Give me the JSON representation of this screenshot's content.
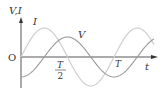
{
  "chart_data": {
    "type": "line",
    "title": "",
    "xlabel": "t",
    "ylabel": "V,I",
    "origin_label": "O",
    "x_ticks": [
      {
        "label_num": "T",
        "label_den": "2",
        "value": 0.5
      },
      {
        "label": "T",
        "value": 1.0
      }
    ],
    "grid": false,
    "series": [
      {
        "name": "I",
        "function": "sin(2πt/T)",
        "amplitude": 1.5,
        "color": "#cfcfcf",
        "x_range_periods": [
          0,
          1.45
        ]
      },
      {
        "name": "V",
        "function": "-cos(2πt/T)",
        "amplitude": 1.0,
        "color": "#9a9a9a",
        "x_range_periods": [
          0,
          1.45
        ]
      }
    ]
  },
  "labels": {
    "axis_y": "V,I",
    "axis_x": "t",
    "origin": "O",
    "curve_i": "I",
    "curve_v": "V",
    "half_period_num": "T",
    "half_period_den": "2",
    "period": "T"
  },
  "geometry": {
    "origin_x": 21,
    "origin_y": 57,
    "period_px": 93,
    "amp_i_px": 29,
    "amp_v_px": 20,
    "x_end": 154
  }
}
